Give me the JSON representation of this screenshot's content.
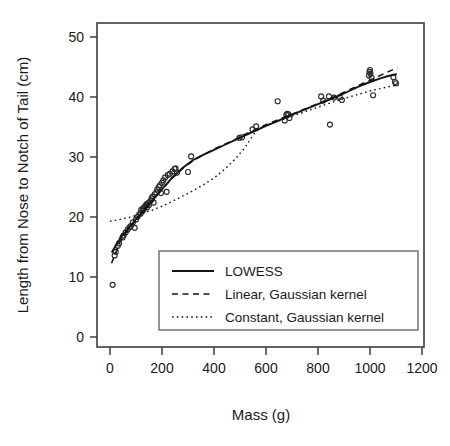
{
  "chart_data": {
    "type": "scatter",
    "title": "",
    "xlabel": "Mass (g)",
    "ylabel": "Length from Nose to Notch of Tail (cm)",
    "xlim": [
      -60,
      1270
    ],
    "ylim": [
      -2.5,
      53
    ],
    "xticks": [
      0,
      200,
      400,
      600,
      800,
      1000,
      1200
    ],
    "yticks": [
      0,
      10,
      20,
      30,
      40,
      50
    ],
    "xtick_labels": [
      "0",
      "200",
      "400",
      "600",
      "800",
      "1000",
      "1200"
    ],
    "ytick_labels": [
      "0",
      "10",
      "20",
      "30",
      "40",
      "50"
    ],
    "grid": false,
    "legend_position": "bottom-center-right",
    "marker_style": "open-circle",
    "points": [
      [
        10,
        8.7
      ],
      [
        18,
        13.6
      ],
      [
        22,
        14.2
      ],
      [
        30,
        15.2
      ],
      [
        35,
        15.6
      ],
      [
        48,
        16.6
      ],
      [
        52,
        16.9
      ],
      [
        60,
        17.4
      ],
      [
        68,
        17.9
      ],
      [
        75,
        18.3
      ],
      [
        80,
        18.5
      ],
      [
        88,
        19.1
      ],
      [
        95,
        18.2
      ],
      [
        100,
        19.6
      ],
      [
        105,
        20.0
      ],
      [
        112,
        20.4
      ],
      [
        118,
        20.6
      ],
      [
        120,
        21.2
      ],
      [
        125,
        21.0
      ],
      [
        128,
        21.5
      ],
      [
        130,
        21.3
      ],
      [
        134,
        21.7
      ],
      [
        138,
        21.9
      ],
      [
        140,
        22.1
      ],
      [
        142,
        21.6
      ],
      [
        146,
        22.3
      ],
      [
        150,
        22.0
      ],
      [
        152,
        22.5
      ],
      [
        158,
        22.8
      ],
      [
        160,
        23.1
      ],
      [
        164,
        23.4
      ],
      [
        168,
        22.4
      ],
      [
        172,
        23.8
      ],
      [
        178,
        24.1
      ],
      [
        182,
        24.6
      ],
      [
        188,
        25.0
      ],
      [
        192,
        25.3
      ],
      [
        196,
        24.0
      ],
      [
        200,
        25.7
      ],
      [
        205,
        26.1
      ],
      [
        212,
        26.6
      ],
      [
        218,
        24.2
      ],
      [
        222,
        27.0
      ],
      [
        230,
        27.2
      ],
      [
        240,
        27.6
      ],
      [
        248,
        28.0
      ],
      [
        252,
        28.1
      ],
      [
        258,
        27.4
      ],
      [
        300,
        27.5
      ],
      [
        312,
        30.1
      ],
      [
        498,
        33.2
      ],
      [
        508,
        33.3
      ],
      [
        548,
        34.6
      ],
      [
        562,
        35.1
      ],
      [
        645,
        39.3
      ],
      [
        672,
        36.1
      ],
      [
        678,
        37.0
      ],
      [
        682,
        37.2
      ],
      [
        686,
        37.1
      ],
      [
        690,
        36.5
      ],
      [
        812,
        40.1
      ],
      [
        820,
        39.4
      ],
      [
        842,
        40.1
      ],
      [
        846,
        35.4
      ],
      [
        862,
        39.9
      ],
      [
        884,
        40.0
      ],
      [
        892,
        39.5
      ],
      [
        996,
        43.6
      ],
      [
        998,
        44.2
      ],
      [
        1000,
        44.5
      ],
      [
        1002,
        43.9
      ],
      [
        1006,
        43.2
      ],
      [
        1012,
        40.3
      ],
      [
        1090,
        43.3
      ],
      [
        1096,
        42.5
      ],
      [
        1100,
        42.3
      ]
    ],
    "series": [
      {
        "name": "LOWESS",
        "style": "solid",
        "points": [
          [
            8,
            14.2
          ],
          [
            40,
            16.5
          ],
          [
            80,
            18.6
          ],
          [
            120,
            20.6
          ],
          [
            160,
            22.6
          ],
          [
            200,
            24.6
          ],
          [
            240,
            26.6
          ],
          [
            280,
            28.2
          ],
          [
            320,
            29.5
          ],
          [
            360,
            30.4
          ],
          [
            400,
            31.2
          ],
          [
            440,
            32.0
          ],
          [
            480,
            32.8
          ],
          [
            520,
            33.6
          ],
          [
            560,
            34.4
          ],
          [
            600,
            35.2
          ],
          [
            640,
            35.9
          ],
          [
            680,
            36.7
          ],
          [
            720,
            37.4
          ],
          [
            760,
            38.1
          ],
          [
            800,
            38.8
          ],
          [
            840,
            39.5
          ],
          [
            880,
            40.2
          ],
          [
            920,
            41.0
          ],
          [
            960,
            41.8
          ],
          [
            1000,
            42.5
          ],
          [
            1040,
            43.1
          ],
          [
            1070,
            43.5
          ],
          [
            1100,
            43.8
          ]
        ]
      },
      {
        "name": "Linear, Gaussian kernel",
        "style": "dashed",
        "points": [
          [
            6,
            12.3
          ],
          [
            40,
            16.0
          ],
          [
            80,
            18.5
          ],
          [
            120,
            20.6
          ],
          [
            160,
            22.6
          ],
          [
            200,
            24.6
          ],
          [
            240,
            26.5
          ],
          [
            280,
            28.1
          ],
          [
            320,
            29.4
          ],
          [
            360,
            30.4
          ],
          [
            400,
            31.3
          ],
          [
            440,
            32.1
          ],
          [
            480,
            32.9
          ],
          [
            520,
            33.8
          ],
          [
            560,
            34.6
          ],
          [
            600,
            35.4
          ],
          [
            640,
            36.1
          ],
          [
            680,
            36.8
          ],
          [
            720,
            37.5
          ],
          [
            760,
            38.2
          ],
          [
            800,
            38.9
          ],
          [
            840,
            39.6
          ],
          [
            880,
            40.4
          ],
          [
            920,
            41.2
          ],
          [
            960,
            42.0
          ],
          [
            1000,
            42.8
          ],
          [
            1040,
            43.6
          ],
          [
            1080,
            44.4
          ],
          [
            1105,
            44.9
          ]
        ]
      },
      {
        "name": "Constant, Gaussian kernel",
        "style": "dotted",
        "points": [
          [
            0,
            19.3
          ],
          [
            40,
            19.6
          ],
          [
            80,
            20.0
          ],
          [
            120,
            20.5
          ],
          [
            160,
            21.1
          ],
          [
            200,
            21.8
          ],
          [
            240,
            22.6
          ],
          [
            280,
            23.5
          ],
          [
            320,
            24.4
          ],
          [
            360,
            25.4
          ],
          [
            400,
            26.5
          ],
          [
            440,
            27.9
          ],
          [
            480,
            29.6
          ],
          [
            520,
            31.6
          ],
          [
            540,
            33.0
          ],
          [
            560,
            34.2
          ],
          [
            580,
            34.9
          ],
          [
            600,
            35.3
          ],
          [
            640,
            35.9
          ],
          [
            680,
            36.5
          ],
          [
            720,
            37.1
          ],
          [
            760,
            37.7
          ],
          [
            800,
            38.3
          ],
          [
            840,
            38.9
          ],
          [
            880,
            39.5
          ],
          [
            920,
            40.0
          ],
          [
            960,
            40.5
          ],
          [
            1000,
            41.0
          ],
          [
            1040,
            41.4
          ],
          [
            1080,
            41.8
          ],
          [
            1110,
            42.0
          ]
        ]
      }
    ],
    "legend_entries": [
      {
        "label": "LOWESS",
        "style": "solid"
      },
      {
        "label": "Linear, Gaussian kernel",
        "style": "dashed"
      },
      {
        "label": "Constant, Gaussian kernel",
        "style": "dotted"
      }
    ],
    "colors": {
      "line": "#141414",
      "marker": "#2b2b2b",
      "axis": "#3d3d3d",
      "text": "#1a1a1a",
      "background": "#ffffff"
    }
  }
}
